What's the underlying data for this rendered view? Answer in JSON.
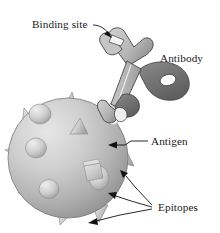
{
  "figure": {
    "background_color": "#ffffff",
    "width": 220,
    "height": 233,
    "labels": {
      "binding_site": "Binding site",
      "antibody": "Antibody",
      "antigen": "Antigen",
      "epitopes": "Epitopes"
    },
    "colors": {
      "text": "#1a1a1a",
      "leader_line": "#111111",
      "antigen_light": "#d9d9d9",
      "antigen_mid": "#b4b4b4",
      "antigen_dark": "#8f8f8f",
      "antigen_outline": "#6e6e6e",
      "epitope_light": "#e2e2e2",
      "epitope_shadow": "#9a9a9a",
      "antibody_light": "#c9c9c9",
      "antibody_mid": "#a8a8a8",
      "antibody_dark": "#6f6f6f",
      "antibody_outline": "#3a3a3a",
      "binding_notch": "#f2f2f2"
    },
    "parts": [
      {
        "name": "antibody",
        "shape": "Y-shaped wrench-like molecule",
        "label": "Antibody"
      },
      {
        "name": "binding-site",
        "shape": "notch between upper prongs",
        "label": "Binding site"
      },
      {
        "name": "antigen",
        "shape": "large shaded sphere",
        "label": "Antigen"
      },
      {
        "name": "epitopes",
        "shape": "cones, domes and cubes on sphere surface",
        "label": "Epitopes"
      }
    ],
    "epitope_shapes": [
      "cone",
      "dome",
      "cube"
    ]
  }
}
